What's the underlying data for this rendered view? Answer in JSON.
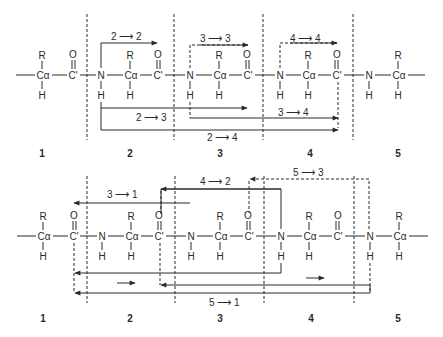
{
  "figure": {
    "colors": {
      "ink": "#2a2a2a",
      "background": "#ffffff"
    },
    "panels": [
      {
        "id": "top",
        "backbone_y": 75,
        "atoms": [
          {
            "sym": "Cα",
            "x": 43,
            "r": true,
            "h": true
          },
          {
            "sym": "C'",
            "x": 73,
            "o": true
          },
          {
            "sym": "N",
            "x": 101,
            "h": true
          },
          {
            "sym": "Cα",
            "x": 131,
            "r": true,
            "h": true
          },
          {
            "sym": "C'",
            "x": 158,
            "o": true
          },
          {
            "sym": "N",
            "x": 190,
            "h": true
          },
          {
            "sym": "Cα",
            "x": 220,
            "r": true,
            "h": true
          },
          {
            "sym": "C'",
            "x": 248,
            "o": true
          },
          {
            "sym": "N",
            "x": 280,
            "h": true
          },
          {
            "sym": "Cα",
            "x": 309,
            "r": true,
            "h": true
          },
          {
            "sym": "C'",
            "x": 337,
            "o": true
          },
          {
            "sym": "N",
            "x": 369,
            "h": true
          },
          {
            "sym": "Cα",
            "x": 399,
            "r": true,
            "h": true
          }
        ],
        "residue_numbers": [
          "1",
          "2",
          "3",
          "4",
          "5"
        ],
        "arrow_labels": {
          "a22": "2 ⟶ 2",
          "a33": "3 ⟶ 3",
          "a44": "4 ⟶ 4",
          "a23": "2 ⟶ 3",
          "a34": "3 ⟶ 4",
          "a24": "2 ⟶ 4"
        }
      },
      {
        "id": "bottom",
        "backbone_y": 236,
        "residue_numbers": [
          "1",
          "2",
          "3",
          "4",
          "5"
        ],
        "arrow_labels": {
          "a31": "3 ⟶ 1",
          "a42": "4 ⟶ 2",
          "a53": "5 ⟶ 3",
          "a51": "5 ⟶ 1"
        }
      }
    ],
    "atom_labels": {
      "R": "R",
      "O": "O",
      "H": "H"
    }
  }
}
